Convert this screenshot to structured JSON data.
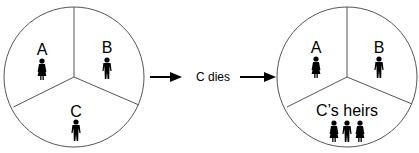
{
  "before": {
    "segments": [
      {
        "label": "A",
        "figure": "female-figure"
      },
      {
        "label": "B",
        "figure": "male-figure"
      },
      {
        "label": "C",
        "figure": "male-figure"
      }
    ]
  },
  "transition": {
    "label": "C dies"
  },
  "after": {
    "segments": [
      {
        "label": "A",
        "figure": "female-figure"
      },
      {
        "label": "B",
        "figure": "male-figure"
      },
      {
        "label": "C’s heirs",
        "figures": [
          "female-figure",
          "male-figure",
          "female-figure"
        ]
      }
    ]
  },
  "colors": {
    "stroke": "#555555",
    "figure": "#000000",
    "arrow": "#000000"
  }
}
